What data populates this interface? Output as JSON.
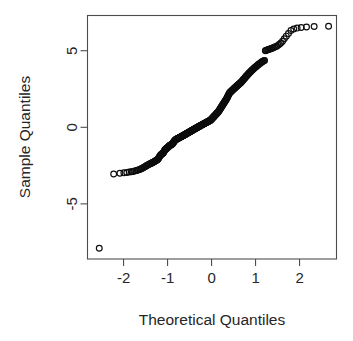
{
  "plot": {
    "type": "qq-plot",
    "background": "#ffffff",
    "frame_color": "#4d4d4d",
    "point_color": "#0d0d0d",
    "text_color": "#262626"
  },
  "axes": {
    "x_title": "Theoretical Quantiles",
    "y_title": "Sample Quantiles",
    "x_ticks": [
      "-2",
      "-1",
      "0",
      "1",
      "2"
    ],
    "y_ticks": [
      "5",
      "0",
      "-5"
    ]
  },
  "chart_data": {
    "type": "scatter",
    "title": "",
    "subtitle": "",
    "xlabel": "Theoretical Quantiles",
    "ylabel": "Sample Quantiles",
    "xlim": [
      -2.82,
      2.84
    ],
    "ylim": [
      -8.6,
      7.3
    ],
    "xticks": [
      -2,
      -1,
      0,
      1,
      2
    ],
    "yticks": [
      5,
      0,
      -5
    ],
    "grid": false,
    "legend": null,
    "marker": "open-circle",
    "n_points": 253,
    "annotations": [],
    "x": [
      -2.553,
      -2.225,
      -2.083,
      -1.993,
      -1.926,
      -1.871,
      -1.825,
      -1.785,
      -1.749,
      -1.716,
      -1.686,
      -1.659,
      -1.633,
      -1.609,
      -1.586,
      -1.565,
      -1.544,
      -1.525,
      -1.506,
      -1.488,
      -1.471,
      -1.454,
      -1.438,
      -1.423,
      -1.408,
      -1.393,
      -1.379,
      -1.365,
      -1.352,
      -1.339,
      -1.326,
      -1.313,
      -1.301,
      -1.289,
      -1.277,
      -1.266,
      -1.255,
      -1.243,
      -1.233,
      -1.222,
      -1.211,
      -1.201,
      -1.19,
      -1.18,
      -1.17,
      -1.16,
      -1.151,
      -1.141,
      -1.132,
      -1.122,
      -1.113,
      -1.104,
      -1.095,
      -1.086,
      -1.077,
      -1.069,
      -1.06,
      -1.052,
      -1.043,
      -1.035,
      -1.026,
      -1.018,
      -1.01,
      -1.002,
      -0.994,
      -0.986,
      -0.978,
      -0.971,
      -0.963,
      -0.955,
      -0.948,
      -0.94,
      -0.933,
      -0.925,
      -0.918,
      -0.91,
      -0.903,
      -0.896,
      -0.889,
      -0.881,
      -0.874,
      -0.867,
      -0.86,
      -0.853,
      -0.846,
      -0.839,
      -0.832,
      -0.826,
      -0.819,
      -0.812,
      -0.805,
      -0.798,
      -0.792,
      -0.785,
      -0.778,
      -0.772,
      -0.765,
      -0.759,
      -0.752,
      -0.746,
      -0.739,
      -0.733,
      -0.726,
      -0.72,
      -0.713,
      -0.707,
      -0.701,
      -0.694,
      -0.688,
      -0.682,
      -0.675,
      -0.669,
      -0.663,
      -0.657,
      -0.65,
      -0.644,
      -0.638,
      -0.632,
      -0.626,
      -0.62,
      -0.613,
      -0.607,
      -0.601,
      -0.595,
      -0.589,
      -0.583,
      -0.577,
      -0.571,
      -0.565,
      -0.559,
      -0.553,
      -0.547,
      -0.541,
      -0.535,
      -0.529,
      -0.523,
      -0.517,
      -0.511,
      -0.505,
      -0.499,
      -0.493,
      -0.487,
      -0.481,
      -0.475,
      -0.469,
      -0.463,
      -0.457,
      -0.451,
      -0.445,
      -0.439,
      -0.433,
      -0.427,
      -0.421,
      -0.415,
      -0.409,
      -0.403,
      -0.397,
      -0.391,
      -0.385,
      -0.379,
      -0.373,
      -0.366,
      -0.36,
      -0.354,
      -0.348,
      -0.342,
      -0.336,
      -0.33,
      -0.324,
      -0.318,
      -0.311,
      -0.305,
      -0.299,
      -0.293,
      -0.287,
      -0.28,
      -0.274,
      -0.268,
      -0.262,
      -0.255,
      -0.249,
      -0.243,
      -0.237,
      -0.23,
      -0.224,
      -0.218,
      -0.211,
      -0.205,
      -0.199,
      -0.192,
      -0.186,
      -0.18,
      -0.173,
      -0.167,
      -0.16,
      -0.154,
      -0.148,
      -0.141,
      -0.135,
      -0.128,
      -0.122,
      -0.115,
      -0.109,
      -0.102,
      -0.096,
      -0.089,
      -0.083,
      -0.076,
      -0.07,
      -0.063,
      -0.057,
      -0.05,
      -0.044,
      -0.037,
      -0.031,
      -0.024,
      -0.018,
      -0.011,
      -0.005,
      0.002,
      0.008,
      0.015,
      0.021,
      0.028,
      0.034,
      0.041,
      0.047,
      0.054,
      0.06,
      0.067,
      0.073,
      0.08,
      0.086,
      0.093,
      0.099,
      0.106,
      0.113,
      0.119,
      0.126,
      0.132,
      0.139,
      0.145,
      0.152,
      0.158,
      0.165,
      0.172,
      0.178,
      0.185,
      0.191,
      0.198,
      0.205,
      0.211,
      0.218,
      0.224,
      0.231,
      0.238,
      0.244,
      0.251,
      0.258,
      0.264,
      0.271,
      0.278,
      0.285,
      0.291,
      0.298,
      0.305,
      0.312,
      0.318,
      0.325,
      0.332,
      0.339,
      0.346,
      0.353,
      0.359,
      0.366,
      0.373,
      0.38,
      0.387,
      0.394,
      0.401,
      0.408,
      0.415,
      0.422,
      0.429,
      0.437,
      0.444,
      0.451,
      0.458,
      0.465,
      0.473,
      0.48,
      0.487,
      0.495,
      0.502,
      0.509,
      0.517,
      0.524,
      0.532,
      0.539,
      0.547,
      0.555,
      0.562,
      0.57,
      0.578,
      0.586,
      0.593,
      0.601,
      0.609,
      0.617,
      0.625,
      0.633,
      0.641,
      0.65,
      0.658,
      0.666,
      0.674,
      0.683,
      0.691,
      0.7,
      0.708,
      0.717,
      0.726,
      0.734,
      0.743,
      0.752,
      0.761,
      0.77,
      0.779,
      0.789,
      0.798,
      0.807,
      0.817,
      0.827,
      0.836,
      0.846,
      0.856,
      0.866,
      0.876,
      0.887,
      0.897,
      0.908,
      0.918,
      0.929,
      0.94,
      0.951,
      0.963,
      0.974,
      0.986,
      0.998,
      1.01,
      1.022,
      1.034,
      1.047,
      1.06,
      1.073,
      1.086,
      1.1,
      1.114,
      1.128,
      1.143,
      1.158,
      1.173,
      1.189,
      1.205,
      1.222,
      1.239,
      1.257,
      1.275,
      1.294,
      1.314,
      1.335,
      1.356,
      1.379,
      1.402,
      1.427,
      1.453,
      1.481,
      1.511,
      1.543,
      1.577,
      1.614,
      1.654,
      1.699,
      1.748,
      1.804,
      1.868,
      1.944,
      2.037,
      2.158,
      2.332,
      2.66
    ],
    "y": [
      -7.9,
      -3.05,
      -3.0,
      -2.97,
      -2.95,
      -2.92,
      -2.9,
      -2.88,
      -2.85,
      -2.83,
      -2.8,
      -2.78,
      -2.75,
      -2.72,
      -2.69,
      -2.66,
      -2.63,
      -2.6,
      -2.56,
      -2.53,
      -2.5,
      -2.47,
      -2.44,
      -2.42,
      -2.4,
      -2.38,
      -2.36,
      -2.34,
      -2.32,
      -2.3,
      -2.28,
      -2.26,
      -2.24,
      -2.22,
      -2.2,
      -2.18,
      -2.16,
      -2.14,
      -2.12,
      -2.1,
      -2.05,
      -2.0,
      -1.95,
      -1.9,
      -1.86,
      -1.82,
      -1.79,
      -1.77,
      -1.75,
      -1.73,
      -1.71,
      -1.69,
      -1.66,
      -1.62,
      -1.57,
      -1.52,
      -1.48,
      -1.45,
      -1.43,
      -1.41,
      -1.39,
      -1.37,
      -1.35,
      -1.33,
      -1.31,
      -1.29,
      -1.27,
      -1.25,
      -1.23,
      -1.21,
      -1.19,
      -1.17,
      -1.16,
      -1.15,
      -1.14,
      -1.13,
      -1.12,
      -1.1,
      -1.08,
      -1.05,
      -1.02,
      -0.99,
      -0.96,
      -0.93,
      -0.9,
      -0.88,
      -0.86,
      -0.84,
      -0.82,
      -0.8,
      -0.79,
      -0.78,
      -0.77,
      -0.76,
      -0.75,
      -0.74,
      -0.73,
      -0.72,
      -0.71,
      -0.7,
      -0.69,
      -0.68,
      -0.67,
      -0.66,
      -0.65,
      -0.64,
      -0.63,
      -0.62,
      -0.61,
      -0.6,
      -0.59,
      -0.58,
      -0.57,
      -0.56,
      -0.55,
      -0.54,
      -0.53,
      -0.52,
      -0.51,
      -0.5,
      -0.49,
      -0.48,
      -0.47,
      -0.46,
      -0.45,
      -0.44,
      -0.43,
      -0.42,
      -0.41,
      -0.4,
      -0.39,
      -0.38,
      -0.37,
      -0.36,
      -0.35,
      -0.34,
      -0.33,
      -0.32,
      -0.31,
      -0.3,
      -0.29,
      -0.28,
      -0.27,
      -0.26,
      -0.25,
      -0.24,
      -0.23,
      -0.22,
      -0.21,
      -0.2,
      -0.19,
      -0.18,
      -0.17,
      -0.16,
      -0.15,
      -0.14,
      -0.13,
      -0.12,
      -0.11,
      -0.1,
      -0.09,
      -0.08,
      -0.07,
      -0.06,
      -0.05,
      -0.04,
      -0.03,
      -0.02,
      -0.01,
      0.0,
      0.01,
      0.02,
      0.03,
      0.04,
      0.05,
      0.06,
      0.07,
      0.08,
      0.09,
      0.1,
      0.11,
      0.12,
      0.13,
      0.14,
      0.15,
      0.16,
      0.17,
      0.18,
      0.19,
      0.2,
      0.21,
      0.22,
      0.23,
      0.24,
      0.25,
      0.26,
      0.27,
      0.28,
      0.29,
      0.3,
      0.31,
      0.32,
      0.33,
      0.34,
      0.35,
      0.36,
      0.37,
      0.38,
      0.39,
      0.4,
      0.41,
      0.42,
      0.43,
      0.44,
      0.45,
      0.46,
      0.48,
      0.5,
      0.52,
      0.54,
      0.56,
      0.58,
      0.6,
      0.62,
      0.64,
      0.66,
      0.68,
      0.7,
      0.72,
      0.74,
      0.76,
      0.78,
      0.8,
      0.82,
      0.84,
      0.86,
      0.88,
      0.9,
      0.92,
      0.94,
      0.96,
      0.98,
      1.0,
      1.03,
      1.06,
      1.09,
      1.12,
      1.15,
      1.18,
      1.21,
      1.24,
      1.27,
      1.3,
      1.33,
      1.36,
      1.39,
      1.42,
      1.45,
      1.48,
      1.51,
      1.54,
      1.57,
      1.6,
      1.63,
      1.66,
      1.69,
      1.72,
      1.75,
      1.78,
      1.81,
      1.84,
      1.88,
      1.92,
      1.96,
      2.0,
      2.04,
      2.08,
      2.12,
      2.16,
      2.2,
      2.24,
      2.26,
      2.28,
      2.3,
      2.32,
      2.34,
      2.36,
      2.38,
      2.4,
      2.42,
      2.44,
      2.46,
      2.48,
      2.5,
      2.52,
      2.54,
      2.56,
      2.58,
      2.6,
      2.62,
      2.64,
      2.66,
      2.68,
      2.7,
      2.72,
      2.74,
      2.76,
      2.78,
      2.8,
      2.82,
      2.84,
      2.86,
      2.88,
      2.9,
      2.92,
      2.94,
      2.97,
      3.0,
      3.03,
      3.06,
      3.09,
      3.12,
      3.15,
      3.18,
      3.21,
      3.24,
      3.27,
      3.3,
      3.33,
      3.36,
      3.39,
      3.42,
      3.45,
      3.48,
      3.51,
      3.54,
      3.57,
      3.6,
      3.63,
      3.66,
      3.69,
      3.72,
      3.75,
      3.78,
      3.81,
      3.84,
      3.87,
      3.9,
      3.93,
      3.96,
      3.99,
      4.02,
      4.05,
      4.08,
      4.11,
      4.14,
      4.17,
      4.2,
      4.23,
      4.26,
      4.29,
      4.32,
      4.34,
      4.36,
      5.0,
      5.02,
      5.04,
      5.06,
      5.08,
      5.1,
      5.12,
      5.14,
      5.16,
      5.19,
      5.22,
      5.26,
      5.3,
      5.35,
      5.42,
      5.5,
      5.62,
      5.78,
      5.95,
      6.12,
      6.32,
      6.42,
      6.48,
      6.52,
      6.55,
      6.58,
      6.6
    ]
  }
}
